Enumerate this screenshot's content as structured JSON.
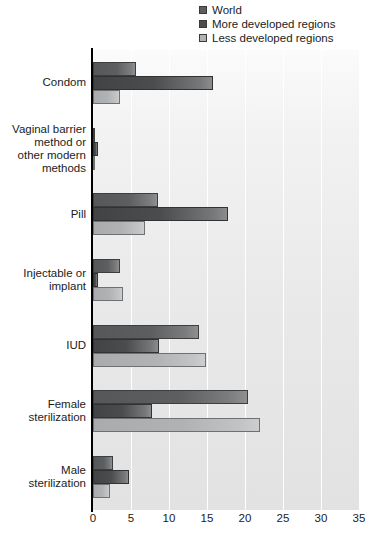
{
  "chart": {
    "type": "bar",
    "orientation": "horizontal",
    "title": "",
    "xlabel": "",
    "ylabel": ""
  },
  "legend": {
    "position": "top-right",
    "items": [
      {
        "label": "World",
        "color": "#5c5e5f",
        "swatch_name": "legend-swatch-world"
      },
      {
        "label": "More developed regions",
        "color": "#4a4c4d",
        "swatch_name": "legend-swatch-more-developed"
      },
      {
        "label": "Less developed regions",
        "color": "#b0b2b3",
        "swatch_name": "legend-swatch-less-developed"
      }
    ]
  },
  "axis": {
    "x_ticks": [
      "0",
      "5",
      "10",
      "15",
      "20",
      "25",
      "30",
      "35"
    ],
    "x_min": 0,
    "x_max": 35,
    "grid": true
  },
  "categories": [
    "Condom",
    "Vaginal barrier method or other modern methods",
    "Pill",
    "Injectable or implant",
    "IUD",
    "Female sterilization",
    "Male sterilization"
  ],
  "category_labels": [
    {
      "lines": [
        "Condom"
      ]
    },
    {
      "lines": [
        "Vaginal barrier",
        "method or",
        "other modern",
        "methods"
      ]
    },
    {
      "lines": [
        "Pill"
      ]
    },
    {
      "lines": [
        "Injectable or",
        "implant"
      ]
    },
    {
      "lines": [
        "IUD"
      ]
    },
    {
      "lines": [
        "Female",
        "sterilization"
      ]
    },
    {
      "lines": [
        "Male",
        "sterilization"
      ]
    }
  ],
  "chart_data": {
    "type": "bar",
    "orientation": "horizontal",
    "title": "",
    "xlabel": "",
    "ylabel": "",
    "xlim": [
      0,
      35
    ],
    "grid": true,
    "legend_position": "top-right",
    "categories": [
      "Condom",
      "Vaginal barrier method or other modern methods",
      "Pill",
      "Injectable or implant",
      "IUD",
      "Female sterilization",
      "Male sterilization"
    ],
    "tick_labels": [
      "0",
      "5",
      "10",
      "15",
      "20",
      "25",
      "30",
      "35"
    ],
    "series": [
      {
        "name": "World",
        "color": "#5c5e5f",
        "values": [
          5.7,
          0.2,
          8.5,
          3.5,
          14.0,
          20.4,
          2.6
        ]
      },
      {
        "name": "More developed regions",
        "color": "#4a4c4d",
        "values": [
          15.8,
          0.7,
          17.8,
          0.6,
          8.7,
          7.8,
          4.7
        ]
      },
      {
        "name": "Less developed regions",
        "color": "#b0b2b3",
        "values": [
          3.6,
          0.1,
          6.9,
          3.9,
          14.9,
          22.0,
          2.3
        ]
      }
    ]
  }
}
